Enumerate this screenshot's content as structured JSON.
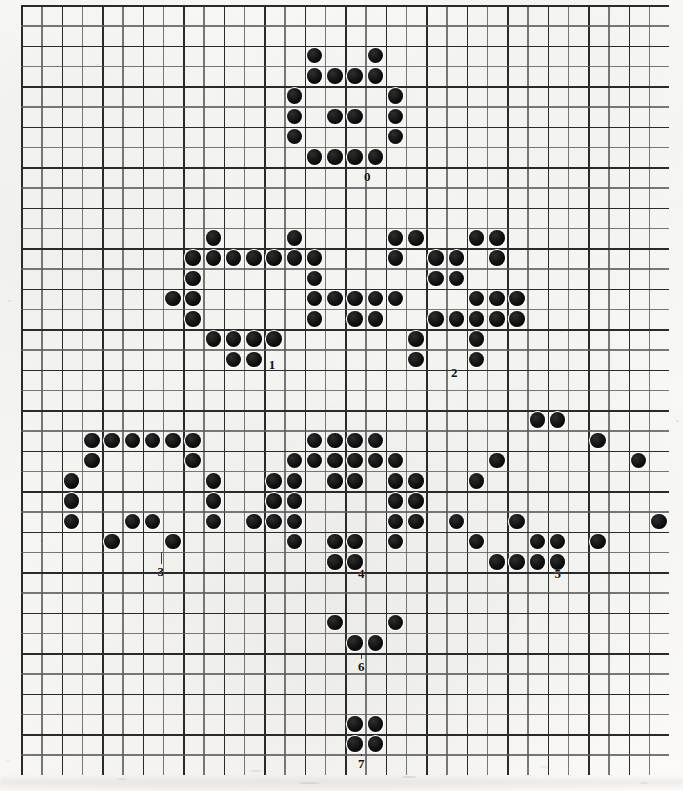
{
  "figure": {
    "grid": {
      "origin_x": 21,
      "origin_y": 5,
      "cell": 20.25,
      "cols": 32,
      "rows": 38,
      "line_color": "#2a2a2a",
      "background": "#fbfaf7"
    },
    "dot": {
      "diameter": 15.5,
      "color": "#000000",
      "halo_color": "#ffffff"
    }
  },
  "chart_data": {
    "type": "scatter",
    "xlabel": "",
    "ylabel": "",
    "grid": true,
    "xlim": [
      0,
      32
    ],
    "ylim": [
      0,
      38
    ],
    "legend": "none",
    "note": "Each cluster is a handwritten-style digit rendered as filled dots on grid cells. Coordinates are (col,row) of the grid, origin top-left.",
    "series": [
      {
        "name": "0",
        "label": "0",
        "label_cell": [
          16.6,
          8.0
        ],
        "points": [
          [
            14,
            2
          ],
          [
            17,
            2
          ],
          [
            14,
            3
          ],
          [
            15,
            3
          ],
          [
            16,
            3
          ],
          [
            17,
            3
          ],
          [
            13,
            4
          ],
          [
            18,
            4
          ],
          [
            13,
            5
          ],
          [
            15,
            5
          ],
          [
            16,
            5
          ],
          [
            18,
            5
          ],
          [
            13,
            6
          ],
          [
            18,
            6
          ],
          [
            14,
            7
          ],
          [
            15,
            7
          ],
          [
            16,
            7
          ],
          [
            17,
            7
          ]
        ]
      },
      {
        "name": "1",
        "label": "1",
        "label_cell": [
          11.9,
          17.3
        ],
        "points": [
          [
            9,
            11
          ],
          [
            13,
            11
          ],
          [
            8,
            12
          ],
          [
            9,
            12
          ],
          [
            10,
            12
          ],
          [
            11,
            12
          ],
          [
            12,
            12
          ],
          [
            13,
            12
          ],
          [
            14,
            12
          ],
          [
            8,
            13
          ],
          [
            14,
            13
          ],
          [
            7,
            14
          ],
          [
            8,
            14
          ],
          [
            14,
            14
          ],
          [
            15,
            14
          ],
          [
            8,
            15
          ],
          [
            14,
            15
          ],
          [
            9,
            16
          ],
          [
            10,
            16
          ],
          [
            11,
            16
          ],
          [
            12,
            16
          ],
          [
            10,
            17
          ],
          [
            11,
            17
          ]
        ]
      },
      {
        "name": "2",
        "label": "2",
        "label_cell": [
          20.9,
          17.7
        ],
        "points": [
          [
            18,
            11
          ],
          [
            19,
            11
          ],
          [
            22,
            11
          ],
          [
            23,
            11
          ],
          [
            18,
            12
          ],
          [
            20,
            12
          ],
          [
            21,
            12
          ],
          [
            23,
            12
          ],
          [
            20,
            13
          ],
          [
            21,
            13
          ],
          [
            16,
            14
          ],
          [
            17,
            14
          ],
          [
            18,
            14
          ],
          [
            22,
            14
          ],
          [
            23,
            14
          ],
          [
            24,
            14
          ],
          [
            16,
            15
          ],
          [
            17,
            15
          ],
          [
            20,
            15
          ],
          [
            21,
            15
          ],
          [
            22,
            15
          ],
          [
            23,
            15
          ],
          [
            24,
            15
          ],
          [
            19,
            16
          ],
          [
            22,
            16
          ],
          [
            19,
            17
          ],
          [
            22,
            17
          ]
        ]
      },
      {
        "name": "3",
        "label": "3",
        "label_cell": [
          6.4,
          27.5
        ],
        "points": [
          [
            3,
            21
          ],
          [
            4,
            21
          ],
          [
            5,
            21
          ],
          [
            6,
            21
          ],
          [
            7,
            21
          ],
          [
            8,
            21
          ],
          [
            3,
            22
          ],
          [
            8,
            22
          ],
          [
            2,
            23
          ],
          [
            9,
            23
          ],
          [
            2,
            24
          ],
          [
            9,
            24
          ],
          [
            2,
            25
          ],
          [
            5,
            25
          ],
          [
            6,
            25
          ],
          [
            9,
            25
          ],
          [
            4,
            26
          ],
          [
            7,
            26
          ]
        ]
      },
      {
        "name": "4",
        "label": "4",
        "label_cell": [
          16.3,
          27.6
        ],
        "points": [
          [
            14,
            21
          ],
          [
            15,
            21
          ],
          [
            16,
            21
          ],
          [
            17,
            21
          ],
          [
            13,
            22
          ],
          [
            14,
            22
          ],
          [
            15,
            22
          ],
          [
            16,
            22
          ],
          [
            17,
            22
          ],
          [
            18,
            22
          ],
          [
            12,
            23
          ],
          [
            13,
            23
          ],
          [
            15,
            23
          ],
          [
            16,
            23
          ],
          [
            18,
            23
          ],
          [
            19,
            23
          ],
          [
            12,
            24
          ],
          [
            13,
            24
          ],
          [
            18,
            24
          ],
          [
            19,
            24
          ],
          [
            11,
            25
          ],
          [
            12,
            25
          ],
          [
            13,
            25
          ],
          [
            18,
            25
          ],
          [
            19,
            25
          ],
          [
            13,
            26
          ],
          [
            15,
            26
          ],
          [
            16,
            26
          ],
          [
            18,
            26
          ],
          [
            15,
            27
          ],
          [
            16,
            27
          ]
        ]
      },
      {
        "name": "5",
        "label": "5",
        "label_cell": [
          26.0,
          27.6
        ],
        "points": [
          [
            25,
            20
          ],
          [
            26,
            20
          ],
          [
            28,
            21
          ],
          [
            23,
            22
          ],
          [
            30,
            22
          ],
          [
            22,
            23
          ],
          [
            21,
            25
          ],
          [
            24,
            25
          ],
          [
            31,
            25
          ],
          [
            22,
            26
          ],
          [
            25,
            26
          ],
          [
            26,
            26
          ],
          [
            28,
            26
          ],
          [
            23,
            27
          ],
          [
            24,
            27
          ],
          [
            25,
            27
          ],
          [
            26,
            27
          ]
        ]
      },
      {
        "name": "6",
        "label": "6",
        "label_cell": [
          16.3,
          32.2
        ],
        "points": [
          [
            15,
            30
          ],
          [
            18,
            30
          ],
          [
            16,
            31
          ],
          [
            17,
            31
          ]
        ]
      },
      {
        "name": "7",
        "label": "7",
        "label_cell": [
          16.3,
          37.0
        ],
        "points": [
          [
            16,
            35
          ],
          [
            17,
            35
          ],
          [
            16,
            36
          ],
          [
            17,
            36
          ]
        ]
      }
    ]
  }
}
